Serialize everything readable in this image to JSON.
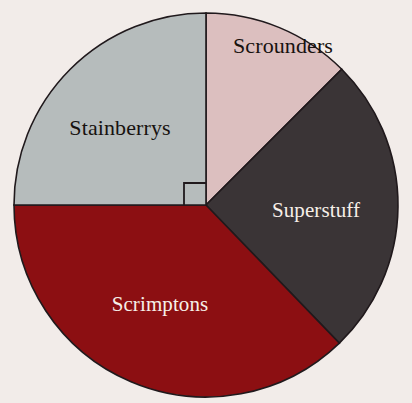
{
  "figure": {
    "background_color": "#f2ece9",
    "outline_color": "#20191c",
    "center": {
      "x": 206,
      "y": 205
    },
    "radius": 192,
    "right_angle_marker": {
      "present": true,
      "description": "square marker at centre between the upward and leftward radii indicating a 90 degree sector",
      "size": 22
    }
  },
  "chart_data": {
    "type": "pie",
    "title": "",
    "subtitle": "",
    "xlabel": "",
    "ylabel": "",
    "legend_position": "none",
    "labels_on_slices": true,
    "start_angle_deg": 0,
    "direction": "clockwise",
    "categories": [
      "Scrounders",
      "Superstuff",
      "Scrimptons",
      "Stainberrys"
    ],
    "values": [
      12.5,
      25.3,
      37.2,
      25.0
    ],
    "angles_deg": [
      45,
      91,
      134,
      90
    ],
    "slices": [
      {
        "label": "Scrounders",
        "value": 12.5,
        "angle_deg": 45,
        "start_deg": 0,
        "end_deg": 45,
        "color": "#dcbfbf",
        "label_color": "#17120f",
        "label_x": 283,
        "label_y": 46
      },
      {
        "label": "Superstuff",
        "value": 25.3,
        "angle_deg": 91,
        "start_deg": 45,
        "end_deg": 136,
        "color": "#3a3436",
        "label_color": "#f6efe8",
        "label_x": 316,
        "label_y": 210
      },
      {
        "label": "Scrimptons",
        "value": 37.2,
        "angle_deg": 134,
        "start_deg": 136,
        "end_deg": 270,
        "color": "#8c0f12",
        "label_color": "#f6efe8",
        "label_x": 160,
        "label_y": 304
      },
      {
        "label": "Stainberrys",
        "value": 25.0,
        "angle_deg": 90,
        "start_deg": 270,
        "end_deg": 360,
        "color": "#b6bcbc",
        "label_color": "#17120f",
        "label_x": 120,
        "label_y": 128
      }
    ]
  }
}
